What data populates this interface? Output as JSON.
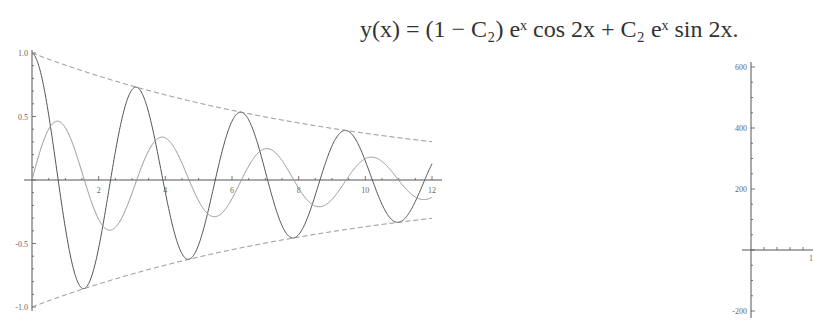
{
  "formula": {
    "text": "y(x) = (1 − C₂) eˣ cos 2x + C₂ eˣ sin 2x."
  },
  "chart_data": [
    {
      "type": "line",
      "title": "",
      "xlabel": "",
      "ylabel": "",
      "xlim": [
        0,
        12
      ],
      "ylim": [
        -1.0,
        1.0
      ],
      "grid": false,
      "x_ticks": [
        "2",
        "4",
        "6",
        "8",
        "10",
        "12"
      ],
      "y_ticks": [
        "1.0",
        "0.5",
        "-0.5",
        "-1.0"
      ],
      "series": [
        {
          "name": "solution (cos component, dark)",
          "style": "solid",
          "color": "#555555",
          "x": [
            0,
            1.57,
            3.14,
            4.71,
            6.28,
            7.85,
            9.42,
            11.0,
            12
          ],
          "values": [
            1.0,
            -0.85,
            0.73,
            -0.62,
            0.53,
            -0.46,
            0.39,
            -0.33,
            0.12
          ]
        },
        {
          "name": "solution (sin component, light)",
          "style": "solid",
          "color": "#999999",
          "x": [
            0,
            0.79,
            2.36,
            3.93,
            5.5,
            7.07,
            8.64,
            10.2,
            11.8
          ],
          "values": [
            0,
            0.46,
            -0.39,
            0.34,
            -0.29,
            0.24,
            -0.21,
            0.18,
            -0.16
          ]
        },
        {
          "name": "upper envelope",
          "style": "dashed",
          "color": "#888888",
          "x": [
            0,
            3,
            6,
            9,
            12
          ],
          "values": [
            1.0,
            0.74,
            0.55,
            0.41,
            0.3
          ]
        },
        {
          "name": "lower envelope",
          "style": "dashed",
          "color": "#888888",
          "x": [
            0,
            3,
            6,
            9,
            12
          ],
          "values": [
            -1.0,
            -0.74,
            -0.55,
            -0.41,
            -0.3
          ]
        }
      ]
    },
    {
      "type": "line",
      "title": "",
      "xlabel": "",
      "ylabel": "",
      "xlim": [
        0,
        1
      ],
      "ylim": [
        -200,
        600
      ],
      "grid": false,
      "x_ticks": [
        "1"
      ],
      "y_ticks": [
        "600",
        "400",
        "200",
        "-200"
      ],
      "series": []
    }
  ]
}
